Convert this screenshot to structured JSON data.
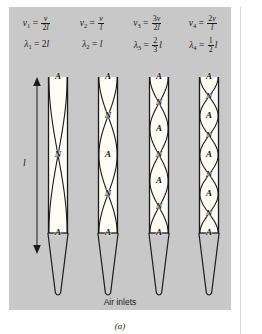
{
  "figure": {
    "background_color": "#c8c8c8",
    "pipe_fill_color": "#fdfdf6",
    "line_color": "#1a1a1a",
    "sub_caption": "(a)",
    "air_inlets_label": "Air inlets",
    "length_symbol": "l"
  },
  "formulas": {
    "frequencies": [
      {
        "symbol": "ν",
        "sub": "1",
        "eq": "=",
        "num": "v",
        "den": "2l"
      },
      {
        "symbol": "ν",
        "sub": "2",
        "eq": "=",
        "num": "v",
        "den": "l"
      },
      {
        "symbol": "ν",
        "sub": "3",
        "eq": "=",
        "num": "3v",
        "den": "2l"
      },
      {
        "symbol": "ν",
        "sub": "4",
        "eq": "=",
        "num": "2v",
        "den": "l"
      }
    ],
    "wavelengths": [
      {
        "symbol": "λ",
        "sub": "1",
        "eq": "=",
        "plain": "2l",
        "num": "",
        "den": "",
        "tail": ""
      },
      {
        "symbol": "λ",
        "sub": "2",
        "eq": "=",
        "plain": "l",
        "num": "",
        "den": "",
        "tail": ""
      },
      {
        "symbol": "λ",
        "sub": "3",
        "eq": "=",
        "plain": "",
        "num": "2",
        "den": "3",
        "tail": "l"
      },
      {
        "symbol": "λ",
        "sub": "4",
        "eq": "=",
        "plain": "",
        "num": "1",
        "den": "2",
        "tail": "l"
      }
    ]
  },
  "pipes": [
    {
      "name": "pipe-1",
      "harmonic": 1,
      "loops": 1,
      "labels": [
        "A",
        "N",
        "A"
      ]
    },
    {
      "name": "pipe-2",
      "harmonic": 2,
      "loops": 2,
      "labels": [
        "A",
        "N",
        "A",
        "N",
        "A"
      ]
    },
    {
      "name": "pipe-3",
      "harmonic": 3,
      "loops": 3,
      "labels": [
        "A",
        "N",
        "A",
        "N",
        "A",
        "N",
        "A"
      ]
    },
    {
      "name": "pipe-4",
      "harmonic": 4,
      "loops": 4,
      "labels": [
        "A",
        "N",
        "A",
        "N",
        "A",
        "N",
        "A",
        "N",
        "A"
      ]
    }
  ]
}
